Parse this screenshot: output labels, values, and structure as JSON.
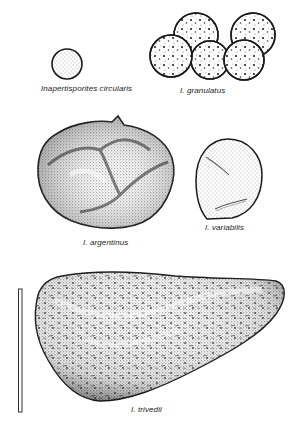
{
  "figure": {
    "specimens": [
      {
        "id": "circularis",
        "label": "Inapertisporites circularis"
      },
      {
        "id": "granulatus",
        "label": "I. granulatus"
      },
      {
        "id": "argentinus",
        "label": "I. argentinus"
      },
      {
        "id": "variabilis",
        "label": "I. variabilis"
      },
      {
        "id": "trivedii",
        "label": "I. trivedii"
      }
    ],
    "scale_bar": {
      "orientation": "vertical"
    }
  },
  "colors": {
    "ink": "#1a1a1a",
    "background": "#ffffff"
  }
}
